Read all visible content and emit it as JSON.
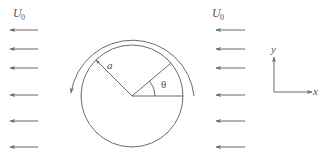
{
  "diagram": {
    "colors": {
      "line": "#6b6b6b",
      "text": "#555555",
      "background": "#ffffff"
    },
    "left_flow": {
      "label": "U",
      "subscript": "0",
      "arrow_count": 6,
      "direction": "left"
    },
    "right_flow": {
      "label": "U",
      "subscript": "0",
      "arrow_count": 6,
      "direction": "left"
    },
    "cylinder": {
      "radius_label": "a",
      "angle_label": "θ",
      "rotation": "counterclockwise"
    },
    "axes": {
      "x_label": "x",
      "y_label": "y"
    }
  }
}
